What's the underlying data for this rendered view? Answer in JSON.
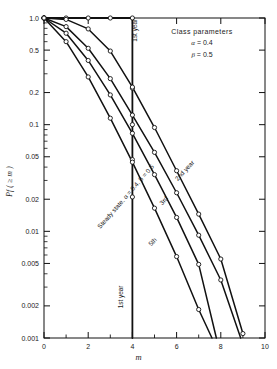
{
  "chart_data": {
    "type": "line",
    "title": "",
    "xlabel": "m",
    "ylabel": "Pf ( ≥ m )",
    "xlim": [
      0,
      10
    ],
    "ylim": [
      0.001,
      1.0
    ],
    "yscale": "log",
    "grid": false,
    "legend_position": "upper-right-inside",
    "x_ticks": [
      "0",
      "2",
      "4",
      "6",
      "8",
      "10"
    ],
    "x_tick_values": [
      0,
      2,
      4,
      6,
      8,
      10
    ],
    "x_minor_ticks": [
      1,
      3,
      5,
      7,
      9
    ],
    "y_ticks": [
      "1.0",
      "0.5",
      "0.2",
      "0.1",
      "0.05",
      "0.02",
      "0.01",
      "0.005",
      "0.002",
      "0.001"
    ],
    "y_tick_values": [
      1.0,
      0.5,
      0.2,
      0.1,
      0.05,
      0.02,
      0.01,
      0.005,
      0.002,
      0.001
    ],
    "annotations": {
      "class_parameters_title": "Class parameters",
      "alpha_label": "α",
      "alpha_value": "= 0.4",
      "beta_label": "β",
      "beta_value": "= 0.5",
      "steady_state": "Steady state, α = 0.4, β = 0.5",
      "first_year_top": "1st year",
      "first_year_bottom": "1st year"
    },
    "series": [
      {
        "name": "1st year",
        "label": "1st year",
        "markers": true,
        "points": [
          {
            "x": 0.0,
            "y": 1.0
          },
          {
            "x": 1.0,
            "y": 1.0
          },
          {
            "x": 2.0,
            "y": 1.0
          },
          {
            "x": 3.0,
            "y": 1.0
          },
          {
            "x": 4.0,
            "y": 1.0
          },
          {
            "x": 4.0,
            "y": 0.22
          },
          {
            "x": 4.0,
            "y": 0.1
          },
          {
            "x": 4.0,
            "y": 0.047
          },
          {
            "x": 4.0,
            "y": 0.021
          },
          {
            "x": 4.0,
            "y": 0.001
          }
        ]
      },
      {
        "name": "2nd year",
        "label": "2nd year",
        "markers": true,
        "points": [
          {
            "x": 0.0,
            "y": 1.0
          },
          {
            "x": 1.0,
            "y": 0.97
          },
          {
            "x": 2.0,
            "y": 0.79
          },
          {
            "x": 3.0,
            "y": 0.49
          },
          {
            "x": 4.0,
            "y": 0.225
          },
          {
            "x": 5.0,
            "y": 0.094
          },
          {
            "x": 6.0,
            "y": 0.037
          },
          {
            "x": 7.0,
            "y": 0.0145
          },
          {
            "x": 8.0,
            "y": 0.0055
          },
          {
            "x": 9.0,
            "y": 0.0011
          }
        ]
      },
      {
        "name": "3rd",
        "label": "3rd",
        "markers": true,
        "points": [
          {
            "x": 0.0,
            "y": 1.0
          },
          {
            "x": 1.0,
            "y": 0.83
          },
          {
            "x": 2.0,
            "y": 0.52
          },
          {
            "x": 3.0,
            "y": 0.27
          },
          {
            "x": 4.0,
            "y": 0.123
          },
          {
            "x": 5.0,
            "y": 0.055
          },
          {
            "x": 6.0,
            "y": 0.023
          },
          {
            "x": 7.0,
            "y": 0.0092
          },
          {
            "x": 8.0,
            "y": 0.0035
          },
          {
            "x": 8.9,
            "y": 0.001
          }
        ]
      },
      {
        "name": "5th",
        "label": "5th",
        "markers": true,
        "points": [
          {
            "x": 0.0,
            "y": 1.0
          },
          {
            "x": 1.0,
            "y": 0.72
          },
          {
            "x": 2.0,
            "y": 0.4
          },
          {
            "x": 3.0,
            "y": 0.19
          },
          {
            "x": 4.0,
            "y": 0.083
          },
          {
            "x": 5.0,
            "y": 0.034
          },
          {
            "x": 6.0,
            "y": 0.0135
          },
          {
            "x": 7.0,
            "y": 0.0049
          },
          {
            "x": 7.8,
            "y": 0.001
          }
        ]
      },
      {
        "name": "Steady state",
        "label": "Steady state, α = 0.4, β = 0.5",
        "markers": true,
        "points": [
          {
            "x": 0.0,
            "y": 1.0
          },
          {
            "x": 1.0,
            "y": 0.6
          },
          {
            "x": 2.0,
            "y": 0.28
          },
          {
            "x": 3.0,
            "y": 0.115
          },
          {
            "x": 4.0,
            "y": 0.0445
          },
          {
            "x": 5.0,
            "y": 0.0165
          },
          {
            "x": 6.0,
            "y": 0.0058
          },
          {
            "x": 7.0,
            "y": 0.00185
          },
          {
            "x": 7.6,
            "y": 0.001
          }
        ]
      }
    ]
  },
  "labels": {
    "y_axis_title": "Pf ( ≥ m )",
    "x_axis_title": "m"
  }
}
